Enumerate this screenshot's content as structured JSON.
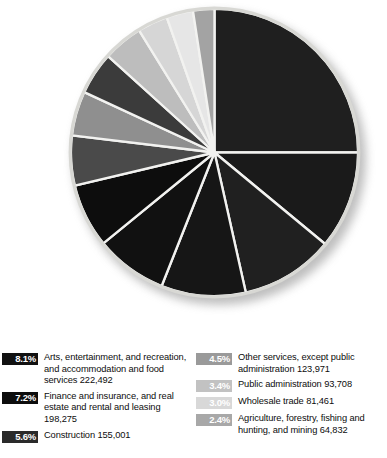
{
  "header": {
    "title": "p?",
    "subtitle": "s"
  },
  "chart_data": {
    "type": "pie",
    "title": "p?",
    "units": "percent of employment",
    "legend_position": "bottom",
    "start_angle_deg": 0,
    "direction": "clockwise",
    "slices": [
      {
        "label": "Educational services, and health care and social assistance",
        "percent": 25.0,
        "value": null,
        "color": "#1f1f1f"
      },
      {
        "label": "Manufacturing",
        "percent": 11.0,
        "value": null,
        "color": "#1a1a1a"
      },
      {
        "label": "Retail trade",
        "percent": 10.5,
        "value": null,
        "color": "#202020"
      },
      {
        "label": "Professional, scientific, and management services",
        "percent": 9.5,
        "value": null,
        "color": "#161616"
      },
      {
        "label": "Arts, entertainment, and recreation, and accommodation and food services",
        "percent": 8.1,
        "value": "222,492",
        "color": "#111111"
      },
      {
        "label": "Finance and insurance, and real estate and rental and leasing",
        "percent": 7.2,
        "value": "198,275",
        "color": "#0d0d0d"
      },
      {
        "label": "Construction",
        "percent": 5.6,
        "value": "155,001",
        "color": "#4a4a4a"
      },
      {
        "label": "Transportation and warehousing, and utilities",
        "percent": 5.0,
        "value": null,
        "color": "#8f8f8f"
      },
      {
        "label": "Information",
        "percent": 4.8,
        "value": null,
        "color": "#3b3b3b"
      },
      {
        "label": "Other services, except public administration",
        "percent": 4.5,
        "value": "123,971",
        "color": "#bdbdbd"
      },
      {
        "label": "Public administration",
        "percent": 3.4,
        "value": "93,708",
        "color": "#d6d6d6"
      },
      {
        "label": "Wholesale trade",
        "percent": 3.0,
        "value": "81,461",
        "color": "#e6e6e6"
      },
      {
        "label": "Agriculture, forestry, fishing and hunting, and mining",
        "percent": 2.4,
        "value": "64,832",
        "color": "#a3a3a3"
      }
    ]
  },
  "legend": {
    "left_column": [
      {
        "percent": "8.1%",
        "label": "Arts, entertainment, and recreation, and accommodation and food services 222,492",
        "swatch_color": "#111111",
        "swatch_text_color": "#ffffff"
      },
      {
        "percent": "7.2%",
        "label": "Finance and insurance, and real estate and rental and leasing 198,275",
        "swatch_color": "#0d0d0d",
        "swatch_text_color": "#ffffff"
      },
      {
        "percent": "5.6%",
        "label": "Construction 155,001",
        "swatch_color": "#2a2a2a",
        "swatch_text_color": "#ffffff"
      }
    ],
    "right_column": [
      {
        "percent": "4.5%",
        "label": "Other services, except public administration 123,971",
        "swatch_color": "#9a9a9a",
        "swatch_text_color": "#ffffff"
      },
      {
        "percent": "3.4%",
        "label": "Public administration 93,708",
        "swatch_color": "#c2c2c2",
        "swatch_text_color": "#ffffff"
      },
      {
        "percent": "3.0%",
        "label": "Wholesale trade 81,461",
        "swatch_color": "#d8d8d8",
        "swatch_text_color": "#ffffff"
      },
      {
        "percent": "2.4%",
        "label": "Agriculture, forestry, fishing and hunting, and mining 64,832",
        "swatch_color": "#a8a8a8",
        "swatch_text_color": "#ffffff"
      }
    ]
  }
}
